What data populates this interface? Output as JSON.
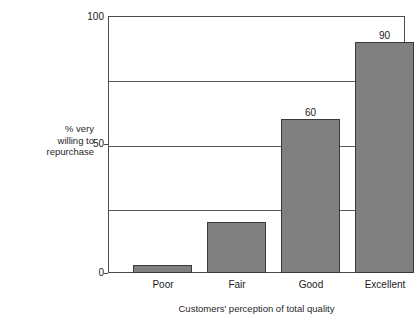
{
  "chart_data": {
    "type": "bar",
    "title": "",
    "categories": [
      "Poor",
      "Fair",
      "Good",
      "Excellent"
    ],
    "values": [
      3,
      20,
      60,
      90
    ],
    "value_labels": [
      "",
      "",
      "60",
      "90"
    ],
    "xlabel": "Customers' perception of total quality",
    "ylabel": "% very willing to repurchase",
    "ylabel_lines": [
      "% very",
      "willing to",
      "repurchase"
    ],
    "ylim": [
      0,
      100
    ],
    "ytick_labels": [
      "0",
      "50",
      "100"
    ],
    "ytick_values": [
      0,
      50,
      100
    ],
    "gridline_values": [
      25,
      50,
      75
    ],
    "grid": true,
    "legend": "none",
    "bar_color": "#808080",
    "bar_border_color": "#3a3a3a",
    "axis_color": "#4a4a4a",
    "gridline_color": "#5a5a5a",
    "background_color": "#ffffff"
  }
}
